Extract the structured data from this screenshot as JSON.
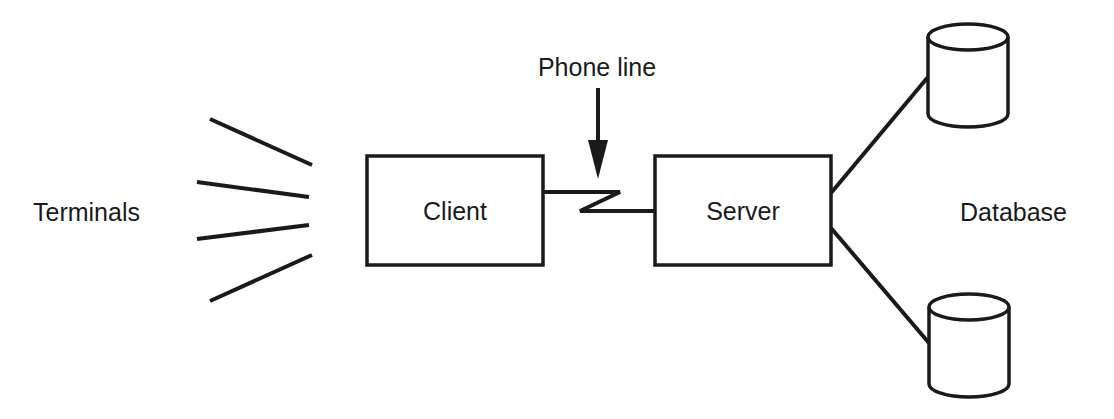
{
  "diagram": {
    "nodes": {
      "terminals": {
        "label": "Terminals",
        "count": 4
      },
      "client": {
        "label": "Client"
      },
      "server": {
        "label": "Server"
      },
      "database": {
        "label": "Database",
        "count": 2
      }
    },
    "annotations": {
      "phone_line": {
        "label": "Phone line"
      }
    },
    "edges": [
      {
        "from": "terminals",
        "to": "client",
        "style": "lines"
      },
      {
        "from": "client",
        "to": "server",
        "style": "zigzag-phone-line"
      },
      {
        "from": "server",
        "to": "database-1",
        "style": "line"
      },
      {
        "from": "server",
        "to": "database-2",
        "style": "line"
      }
    ],
    "colors": {
      "ink": "#1a1a1a",
      "background": "#ffffff"
    }
  }
}
